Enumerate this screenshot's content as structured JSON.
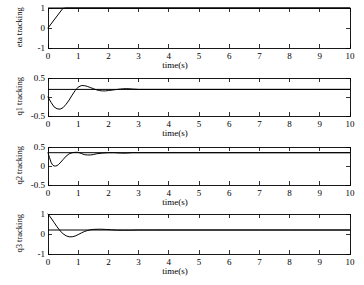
{
  "figure": {
    "background_color": "#ffffff",
    "line_color": "#000000",
    "width": 364,
    "height": 285
  },
  "chart_data": [
    {
      "type": "line",
      "name": "eta-tracking",
      "title": "",
      "xlabel": "time(s)",
      "ylabel": "eta tracking",
      "xlim": [
        0,
        10
      ],
      "ylim": [
        -1,
        1
      ],
      "xticks": [
        0,
        1,
        2,
        3,
        4,
        5,
        6,
        7,
        8,
        9,
        10
      ],
      "xticklabels": [
        "0",
        "1",
        "2",
        "3",
        "4",
        "5",
        "6",
        "7",
        "8",
        "9",
        "10"
      ],
      "yticks": [
        -1,
        0,
        1
      ],
      "yticklabels": [
        "-1",
        "0",
        "1"
      ],
      "grid": false,
      "legend": null,
      "series": [
        {
          "name": "eta response",
          "x": [
            0,
            0.05,
            0.1,
            0.15,
            0.2,
            0.25,
            0.3,
            0.35,
            0.4,
            0.45,
            0.5,
            0.6,
            0.8,
            1.0,
            1.5,
            2.0,
            3.0,
            4.0,
            5.0,
            6.0,
            7.0,
            8.0,
            9.0,
            10.0
          ],
          "y": [
            0.0,
            0.1,
            0.2,
            0.3,
            0.4,
            0.5,
            0.6,
            0.7,
            0.8,
            0.9,
            0.98,
            1.0,
            1.0,
            1.0,
            1.0,
            1.0,
            1.0,
            1.0,
            1.0,
            1.0,
            1.0,
            1.0,
            1.0,
            1.0
          ]
        },
        {
          "name": "eta reference",
          "x": [
            0,
            10
          ],
          "y": [
            1.0,
            1.0
          ]
        }
      ]
    },
    {
      "type": "line",
      "name": "q1-tracking",
      "title": "",
      "xlabel": "time(s)",
      "ylabel": "q1 tracking",
      "xlim": [
        0,
        10
      ],
      "ylim": [
        -0.5,
        0.5
      ],
      "xticks": [
        0,
        1,
        2,
        3,
        4,
        5,
        6,
        7,
        8,
        9,
        10
      ],
      "xticklabels": [
        "0",
        "1",
        "2",
        "3",
        "4",
        "5",
        "6",
        "7",
        "8",
        "9",
        "10"
      ],
      "yticks": [
        -0.5,
        0,
        0.5
      ],
      "yticklabels": [
        "-0.5",
        "0",
        "0.5"
      ],
      "grid": false,
      "legend": null,
      "series": [
        {
          "name": "q1 response",
          "x": [
            0,
            0.1,
            0.2,
            0.3,
            0.4,
            0.5,
            0.6,
            0.7,
            0.8,
            0.9,
            1.0,
            1.1,
            1.2,
            1.3,
            1.4,
            1.5,
            1.6,
            1.7,
            1.8,
            1.9,
            2.0,
            2.2,
            2.4,
            2.6,
            2.8,
            3.0,
            3.5,
            4.0,
            5.0,
            6.0,
            7.0,
            8.0,
            9.0,
            10.0
          ],
          "y": [
            0.0,
            -0.14,
            -0.26,
            -0.31,
            -0.32,
            -0.28,
            -0.19,
            -0.08,
            0.05,
            0.17,
            0.26,
            0.3,
            0.3,
            0.28,
            0.25,
            0.22,
            0.19,
            0.17,
            0.16,
            0.16,
            0.17,
            0.19,
            0.21,
            0.22,
            0.21,
            0.2,
            0.2,
            0.2,
            0.2,
            0.2,
            0.2,
            0.2,
            0.2,
            0.2
          ]
        },
        {
          "name": "q1 reference",
          "x": [
            0,
            10
          ],
          "y": [
            0.2,
            0.2
          ]
        }
      ]
    },
    {
      "type": "line",
      "name": "q2-tracking",
      "title": "",
      "xlabel": "time(s)",
      "ylabel": "q2 tracking",
      "xlim": [
        0,
        10
      ],
      "ylim": [
        -0.5,
        0.5
      ],
      "xticks": [
        0,
        1,
        2,
        3,
        4,
        5,
        6,
        7,
        8,
        9,
        10
      ],
      "xticklabels": [
        "0",
        "1",
        "2",
        "3",
        "4",
        "5",
        "6",
        "7",
        "8",
        "9",
        "10"
      ],
      "yticks": [
        -0.5,
        0,
        0.5
      ],
      "yticklabels": [
        "-0.5",
        "0",
        "0.5"
      ],
      "grid": false,
      "legend": null,
      "series": [
        {
          "name": "q2 response",
          "x": [
            0,
            0.05,
            0.1,
            0.15,
            0.2,
            0.25,
            0.3,
            0.35,
            0.4,
            0.5,
            0.6,
            0.7,
            0.8,
            0.9,
            1.0,
            1.1,
            1.2,
            1.3,
            1.4,
            1.5,
            1.6,
            1.8,
            2.0,
            2.2,
            2.4,
            2.6,
            2.8,
            3.0,
            4.0,
            5.0,
            6.0,
            7.0,
            8.0,
            9.0,
            10.0
          ],
          "y": [
            0.35,
            0.22,
            0.1,
            0.03,
            0.0,
            0.0,
            0.01,
            0.04,
            0.08,
            0.17,
            0.26,
            0.32,
            0.35,
            0.36,
            0.36,
            0.33,
            0.3,
            0.29,
            0.29,
            0.3,
            0.32,
            0.34,
            0.35,
            0.35,
            0.34,
            0.34,
            0.35,
            0.35,
            0.35,
            0.35,
            0.35,
            0.35,
            0.35,
            0.35,
            0.35
          ]
        },
        {
          "name": "q2 reference",
          "x": [
            0,
            10
          ],
          "y": [
            0.35,
            0.35
          ]
        }
      ]
    },
    {
      "type": "line",
      "name": "q3-tracking",
      "title": "",
      "xlabel": "time(s)",
      "ylabel": "q3 tracking",
      "xlim": [
        0,
        10
      ],
      "ylim": [
        -1,
        1
      ],
      "xticks": [
        0,
        1,
        2,
        3,
        4,
        5,
        6,
        7,
        8,
        9,
        10
      ],
      "xticklabels": [
        "0",
        "1",
        "2",
        "3",
        "4",
        "5",
        "6",
        "7",
        "8",
        "9",
        "10"
      ],
      "yticks": [
        -1,
        0,
        1
      ],
      "yticklabels": [
        "-1",
        "0",
        "1"
      ],
      "grid": false,
      "legend": null,
      "series": [
        {
          "name": "q3 response",
          "x": [
            0,
            0.1,
            0.2,
            0.3,
            0.4,
            0.5,
            0.6,
            0.7,
            0.8,
            0.9,
            1.0,
            1.1,
            1.2,
            1.3,
            1.4,
            1.5,
            1.7,
            1.9,
            2.1,
            2.3,
            2.5,
            2.7,
            3.0,
            3.5,
            4.0,
            5.0,
            6.0,
            7.0,
            8.0,
            9.0,
            10.0
          ],
          "y": [
            1.0,
            0.8,
            0.58,
            0.36,
            0.16,
            0.01,
            -0.09,
            -0.14,
            -0.14,
            -0.1,
            -0.03,
            0.05,
            0.12,
            0.17,
            0.21,
            0.23,
            0.24,
            0.23,
            0.21,
            0.19,
            0.19,
            0.19,
            0.2,
            0.2,
            0.2,
            0.2,
            0.2,
            0.2,
            0.2,
            0.2,
            0.2
          ]
        },
        {
          "name": "q3 reference",
          "x": [
            0,
            10
          ],
          "y": [
            0.2,
            0.2
          ]
        }
      ]
    }
  ]
}
